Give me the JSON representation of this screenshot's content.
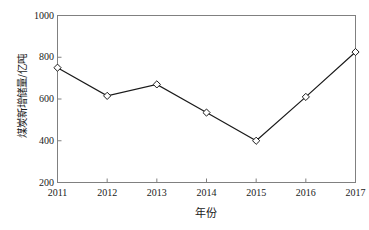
{
  "chart_data": {
    "type": "line",
    "title": "",
    "subtitle": "",
    "xlabel": "年份",
    "ylabel": "煤炭新增储量/亿吨",
    "categories": [
      "2011",
      "2012",
      "2013",
      "2014",
      "2015",
      "2016",
      "2017"
    ],
    "x": [
      2011,
      2012,
      2013,
      2014,
      2015,
      2016,
      2017
    ],
    "values": [
      750,
      615,
      670,
      535,
      400,
      610,
      825
    ],
    "series": [
      {
        "name": "煤炭新增储量",
        "values": [
          750,
          615,
          670,
          535,
          400,
          610,
          825
        ]
      }
    ],
    "ylim": [
      200,
      1000
    ],
    "xlim": [
      2011,
      2017
    ],
    "yticks": [
      200,
      400,
      600,
      800,
      1000
    ],
    "ytick_labels": [
      "200",
      "400",
      "600",
      "800",
      "1000"
    ],
    "xticks": [
      2011,
      2012,
      2013,
      2014,
      2015,
      2016,
      2017
    ],
    "xtick_labels": [
      "2011",
      "2012",
      "2013",
      "2014",
      "2015",
      "2016",
      "2017"
    ],
    "grid": false,
    "legend": null,
    "legend_position": "none",
    "marker": "diamond-open",
    "line_color": "#1a1a1a",
    "marker_face_color": "#ffffff",
    "marker_edge_color": "#1a1a1a",
    "axis_color": "#808080",
    "background_color": "#ffffff",
    "annotations": []
  },
  "axes": {
    "y_title": "煤炭新增储量/亿吨",
    "x_title": "年份"
  }
}
